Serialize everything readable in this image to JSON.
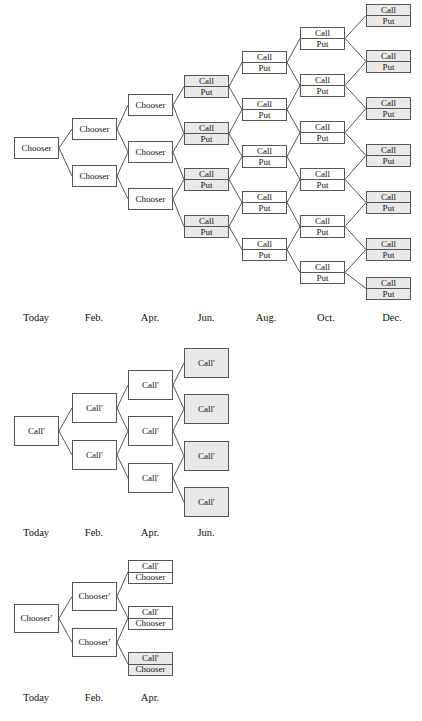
{
  "page": {
    "background": "#ffffff",
    "box_border_color": "#555555",
    "box_fill_plain": "#ffffff",
    "box_fill_shaded": "#e9e9e9"
  },
  "figures": [
    {
      "id": "chooser-tree-full",
      "name": "compound-chooser-option-tree",
      "top": 0,
      "axis_labels": [
        {
          "text": "Today",
          "x": 36,
          "y": 312
        },
        {
          "text": "Feb.",
          "x": 94,
          "y": 312
        },
        {
          "text": "Apr.",
          "x": 150,
          "y": 312
        },
        {
          "text": "Jun.",
          "x": 206,
          "y": 312
        },
        {
          "text": "Aug.",
          "x": 266,
          "y": 312
        },
        {
          "text": "Oct.",
          "x": 326,
          "y": 312
        },
        {
          "text": "Dec.",
          "x": 392,
          "y": 312
        }
      ],
      "columns": [
        {
          "name": "today",
          "x": 14,
          "w": 45,
          "rows": 1,
          "type": "single",
          "label": "Chooser",
          "ys": [
            137
          ],
          "h": 22,
          "shaded": [
            false
          ]
        },
        {
          "name": "feb",
          "x": 72,
          "w": 45,
          "rows": 2,
          "type": "single",
          "label": "Chooser",
          "ys": [
            118,
            165
          ],
          "h": 22,
          "shaded": [
            false,
            false
          ]
        },
        {
          "name": "apr",
          "x": 128,
          "w": 45,
          "rows": 3,
          "type": "single",
          "label": "Chooser",
          "ys": [
            94,
            141,
            188
          ],
          "h": 22,
          "shaded": [
            false,
            false,
            false
          ]
        },
        {
          "name": "jun",
          "x": 184,
          "w": 45,
          "rows": 4,
          "type": "double",
          "labels": [
            "Call",
            "Put"
          ],
          "ys": [
            75,
            122,
            168,
            215
          ],
          "h": 23,
          "shaded": [
            true,
            true,
            true,
            true
          ]
        },
        {
          "name": "aug",
          "x": 242,
          "w": 45,
          "rows": 5,
          "type": "double",
          "labels": [
            "Call",
            "Put"
          ],
          "ys": [
            51,
            98,
            145,
            191,
            238
          ],
          "h": 23,
          "shaded": [
            false,
            false,
            false,
            false,
            false
          ]
        },
        {
          "name": "oct",
          "x": 300,
          "w": 45,
          "rows": 6,
          "type": "double",
          "labels": [
            "Call",
            "Put"
          ],
          "ys": [
            27,
            74,
            121,
            168,
            215,
            261
          ],
          "h": 23,
          "shaded": [
            false,
            false,
            false,
            false,
            false,
            false
          ]
        },
        {
          "name": "dec",
          "x": 366,
          "w": 45,
          "rows": 7,
          "type": "double",
          "labels": [
            "Call",
            "Put"
          ],
          "ys": [
            4,
            50,
            97,
            144,
            191,
            238,
            277
          ],
          "h": 23,
          "shaded": [
            true,
            true,
            true,
            true,
            true,
            true,
            true
          ]
        }
      ]
    },
    {
      "id": "call-prime-tree",
      "name": "compound-call-option-tree",
      "top": 0,
      "axis_labels": [
        {
          "text": "Today",
          "x": 36,
          "y": 527
        },
        {
          "text": "Feb.",
          "x": 94,
          "y": 527
        },
        {
          "text": "Apr.",
          "x": 150,
          "y": 527
        },
        {
          "text": "Jun.",
          "x": 206,
          "y": 527
        }
      ],
      "columns": [
        {
          "name": "today",
          "x": 14,
          "w": 45,
          "rows": 1,
          "type": "single",
          "label": "Call′",
          "ys": [
            416
          ],
          "h": 30,
          "shaded": [
            false
          ]
        },
        {
          "name": "feb",
          "x": 72,
          "w": 45,
          "rows": 2,
          "type": "single",
          "label": "Call′",
          "ys": [
            393,
            440
          ],
          "h": 30,
          "shaded": [
            false,
            false
          ]
        },
        {
          "name": "apr",
          "x": 128,
          "w": 45,
          "rows": 3,
          "type": "single",
          "label": "Call′",
          "ys": [
            370,
            416,
            463
          ],
          "h": 30,
          "shaded": [
            false,
            false,
            false
          ]
        },
        {
          "name": "jun",
          "x": 184,
          "w": 45,
          "rows": 4,
          "type": "single",
          "label": "Call′",
          "ys": [
            348,
            394,
            441,
            487
          ],
          "h": 30,
          "shaded": [
            true,
            true,
            true,
            true
          ]
        }
      ]
    },
    {
      "id": "chooser-prime-tree",
      "name": "compound-chooser-prime-tree",
      "top": 0,
      "axis_labels": [
        {
          "text": "Today",
          "x": 36,
          "y": 692
        },
        {
          "text": "Feb.",
          "x": 94,
          "y": 692
        },
        {
          "text": "Apr.",
          "x": 150,
          "y": 692
        }
      ],
      "columns": [
        {
          "name": "today",
          "x": 14,
          "w": 45,
          "rows": 1,
          "type": "single",
          "label": "Chooser′",
          "ys": [
            604
          ],
          "h": 29,
          "shaded": [
            false
          ]
        },
        {
          "name": "feb",
          "x": 72,
          "w": 45,
          "rows": 2,
          "type": "single",
          "label": "Chooser′",
          "ys": [
            582,
            628
          ],
          "h": 29,
          "shaded": [
            false,
            false
          ]
        },
        {
          "name": "apr",
          "x": 128,
          "w": 45,
          "rows": 3,
          "type": "double",
          "labels": [
            "Call′",
            "Chooser"
          ],
          "ys": [
            560,
            606,
            652
          ],
          "h": 24,
          "shaded": [
            false,
            false,
            true
          ]
        }
      ]
    }
  ]
}
